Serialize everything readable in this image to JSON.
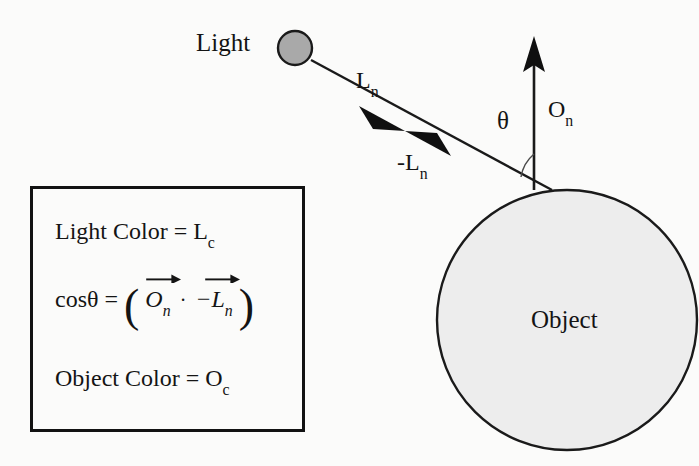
{
  "diagram": {
    "background_color": "#fbfbfa",
    "stroke_color": "#1a1a1a",
    "labels": {
      "light": "Light",
      "light_vector": "L",
      "light_vector_sub": "n",
      "neg_light_vector": "-L",
      "neg_light_vector_sub": "n",
      "theta": "θ",
      "normal_vector": "O",
      "normal_vector_sub": "n",
      "object": "Object"
    },
    "shapes": {
      "light_source": {
        "name": "light-source-circle",
        "cx": 295,
        "cy": 48,
        "r": 17,
        "fill": "#a9a9a9",
        "stroke": "#1a1a1a"
      },
      "object_sphere": {
        "name": "object-sphere",
        "cx": 567,
        "cy": 320,
        "r": 130,
        "fill": "#ededed",
        "stroke": "#1a1a1a"
      },
      "light_ray": {
        "name": "light-ray-line",
        "x1": 311,
        "y1": 60,
        "x2": 552,
        "y2": 190
      },
      "normal_ray": {
        "name": "normal-vector-line",
        "x1": 534,
        "y1": 190,
        "x2": 534,
        "y2": 38
      },
      "theta_arc": {
        "name": "theta-angle-arc",
        "center_x": 552,
        "center_y": 190
      }
    }
  },
  "equation_box": {
    "name": "equation-box",
    "border_color": "#121212",
    "lines": [
      {
        "id": "light-color",
        "text": "Light Color = L",
        "subscript": "c"
      },
      {
        "id": "cos-theta",
        "lhs": "cosθ  =",
        "open_paren": "(",
        "term1": "O",
        "term1_sub": "n",
        "dot": "·",
        "term2": "−L",
        "term2_sub": "n",
        "close_paren": ")"
      },
      {
        "id": "object-color",
        "text": "Object Color = O",
        "subscript": "c"
      }
    ]
  }
}
